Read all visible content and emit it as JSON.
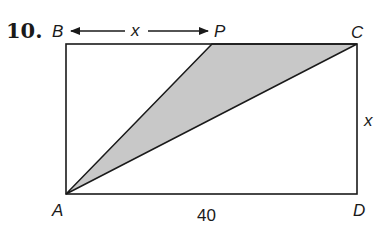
{
  "problem_number": "10.",
  "labels": {
    "B": "B",
    "P": "P",
    "C": "C",
    "A": "A",
    "D": "D"
  },
  "measurements": {
    "BP": "x",
    "CD": "x",
    "AD": "40"
  },
  "colors": {
    "shaded_fill": "#c8c8c8",
    "stroke": "#1a1a1a"
  }
}
